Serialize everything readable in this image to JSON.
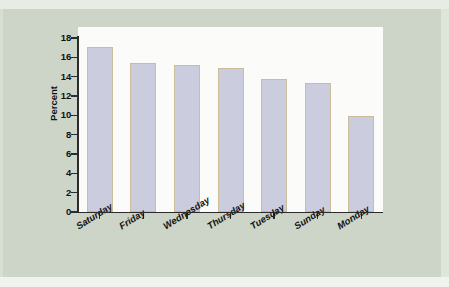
{
  "figure": {
    "background_color": "#ccd5c8",
    "plot_background_color": "#fbfbfa",
    "bar_fill_color": "#ccccdf",
    "bar_border_color": "#c9bd9a",
    "axis_color": "#2b2b2b"
  },
  "chart_data": {
    "type": "bar",
    "title": "",
    "xlabel": "",
    "ylabel": "Percent",
    "categories": [
      "Saturday",
      "Friday",
      "Wednesday",
      "Thursday",
      "Tuesday",
      "Sunday",
      "Monday"
    ],
    "values": [
      17.1,
      15.4,
      15.2,
      14.9,
      13.8,
      13.3,
      9.9
    ],
    "ylim": [
      0,
      18
    ],
    "yticks": [
      0,
      2,
      4,
      6,
      8,
      10,
      12,
      14,
      16,
      18
    ],
    "ytick_labels": [
      "0",
      "2",
      "4",
      "6",
      "8",
      "10",
      "12",
      "14",
      "16",
      "18"
    ],
    "grid": false,
    "legend": false,
    "xtick_label_rotation": -32
  }
}
